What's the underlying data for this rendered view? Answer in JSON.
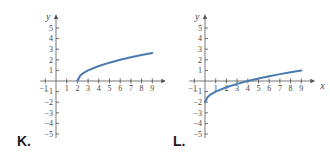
{
  "chart_data": [
    {
      "type": "line",
      "label": "K.",
      "title": "",
      "xlabel": "x",
      "ylabel": "y",
      "xlim": [
        -1,
        9
      ],
      "ylim": [
        -5,
        5
      ],
      "x_ticks": [
        "-1",
        "1",
        "2",
        "3",
        "4",
        "5",
        "6",
        "7",
        "8",
        "9"
      ],
      "y_ticks": [
        "5",
        "4",
        "3",
        "2",
        "1",
        "-1",
        "-2",
        "-3",
        "-4",
        "-5"
      ],
      "grid": false,
      "series": [
        {
          "name": "curve",
          "color": "#4a7ab0",
          "x": [
            2,
            2.25,
            2.5,
            3,
            4,
            5,
            6,
            7,
            8,
            9
          ],
          "y": [
            0,
            0.5,
            0.71,
            1,
            1.41,
            1.73,
            2,
            2.24,
            2.45,
            2.65
          ]
        }
      ]
    },
    {
      "type": "line",
      "label": "L.",
      "title": "",
      "xlabel": "x",
      "ylabel": "y",
      "xlim": [
        -1,
        9
      ],
      "ylim": [
        -5,
        5
      ],
      "x_ticks": [
        "-1",
        "1",
        "2",
        "3",
        "4",
        "5",
        "6",
        "7",
        "8",
        "9"
      ],
      "y_ticks": [
        "5",
        "4",
        "3",
        "2",
        "1",
        "-1",
        "-2",
        "-3",
        "-4",
        "-5"
      ],
      "grid": false,
      "series": [
        {
          "name": "curve",
          "color": "#4a7ab0",
          "x": [
            0,
            0.25,
            0.5,
            1,
            2,
            3,
            4,
            5,
            6,
            7,
            8,
            9
          ],
          "y": [
            -2,
            -1.5,
            -1.29,
            -1,
            -0.59,
            -0.27,
            0,
            0.24,
            0.45,
            0.65,
            0.83,
            1
          ]
        }
      ]
    }
  ],
  "panels": {
    "k": {
      "label": "K."
    },
    "l": {
      "label": "L."
    }
  }
}
